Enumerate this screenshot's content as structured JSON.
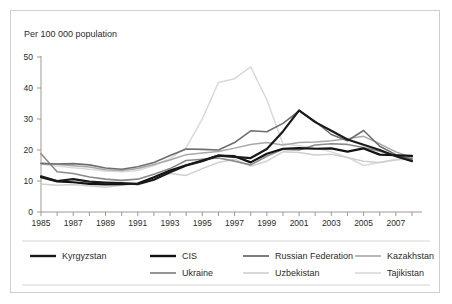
{
  "chart_data": {
    "type": "line",
    "title": "Per 100 000 population",
    "xlabel": "",
    "ylabel": "",
    "xlim": [
      1985,
      2008
    ],
    "ylim": [
      0,
      50
    ],
    "yticks": [
      0,
      10,
      20,
      30,
      40,
      50
    ],
    "ytick_labels": [
      "0",
      "10",
      "20",
      "30",
      "40",
      "50"
    ],
    "x": [
      1985,
      1986,
      1987,
      1988,
      1989,
      1990,
      1991,
      1992,
      1993,
      1994,
      1995,
      1996,
      1997,
      1998,
      1999,
      2000,
      2001,
      2002,
      2003,
      2004,
      2005,
      2006,
      2007,
      2008
    ],
    "xticks": [
      1985,
      1986,
      1987,
      1988,
      1989,
      1990,
      1991,
      1992,
      1993,
      1994,
      1995,
      1996,
      1997,
      1998,
      1999,
      2000,
      2001,
      2002,
      2003,
      2004,
      2005,
      2006,
      2007,
      2008
    ],
    "xtick_labels_shown": [
      "1985",
      "1987",
      "1989",
      "1991",
      "1993",
      "1995",
      "1997",
      "1999",
      "2001",
      "2003",
      "2005",
      "2007"
    ],
    "grid": false,
    "legend_position": "bottom",
    "series": [
      {
        "name": "Kyrgyzstan",
        "color": "#1a1a1a",
        "width": 2.2,
        "values": [
          11.5,
          10.0,
          10.6,
          9.8,
          9.5,
          9.3,
          9.0,
          10.4,
          12.8,
          15.0,
          16.4,
          18.2,
          17.8,
          17.4,
          20.3,
          26.0,
          32.8,
          29.0,
          26.2,
          23.4,
          21.7,
          20.0,
          18.0,
          16.4
        ]
      },
      {
        "name": "CIS",
        "color": "#121212",
        "width": 2.2,
        "values": [
          11.2,
          9.9,
          9.6,
          9.1,
          8.9,
          9.0,
          9.2,
          11.2,
          13.4,
          15.1,
          16.6,
          18.2,
          18.0,
          16.0,
          18.8,
          20.4,
          20.6,
          20.4,
          20.5,
          19.5,
          20.5,
          18.5,
          18.3,
          18.1
        ]
      },
      {
        "name": "Russian Federation",
        "color": "#6e6e6e",
        "width": 1.6,
        "values": [
          15.6,
          15.5,
          15.6,
          15.2,
          14.2,
          13.8,
          14.6,
          16.0,
          18.2,
          20.3,
          20.2,
          20.0,
          22.4,
          26.2,
          25.9,
          28.6,
          32.6,
          29.2,
          25.0,
          23.0,
          26.3,
          21.2,
          18.5,
          17.0
        ]
      },
      {
        "name": "Kazakhstan",
        "color": "#a8a8a8",
        "width": 1.5,
        "values": [
          15.8,
          15.4,
          14.9,
          14.5,
          13.6,
          13.4,
          14.0,
          15.3,
          16.8,
          18.5,
          19.0,
          19.5,
          20.6,
          21.8,
          22.4,
          21.6,
          22.4,
          22.6,
          23.0,
          23.6,
          24.4,
          22.0,
          19.4,
          17.6
        ]
      },
      {
        "name": "Ukraine",
        "color": "#8a8a8a",
        "width": 1.6,
        "values": [
          18.8,
          13.0,
          12.4,
          11.3,
          10.6,
          10.2,
          10.6,
          12.2,
          14.0,
          16.6,
          17.0,
          17.4,
          16.4,
          15.2,
          18.0,
          20.2,
          20.0,
          21.6,
          22.0,
          21.8,
          20.8,
          19.6,
          18.2,
          17.2
        ]
      },
      {
        "name": "Uzbekistan",
        "color": "#cfcfcf",
        "width": 1.5,
        "values": [
          9.0,
          8.6,
          8.9,
          8.4,
          8.0,
          8.6,
          9.2,
          11.0,
          12.4,
          11.8,
          14.0,
          16.0,
          17.0,
          14.8,
          16.4,
          19.4,
          19.2,
          18.4,
          18.6,
          17.6,
          16.4,
          16.0,
          16.8,
          17.2
        ]
      },
      {
        "name": "Tajikistan",
        "color": "#d9d9d9",
        "width": 1.5,
        "values": [
          15.4,
          14.8,
          14.3,
          13.8,
          13.2,
          13.0,
          13.4,
          15.0,
          17.2,
          20.8,
          30.0,
          41.8,
          43.0,
          46.8,
          36.2,
          22.0,
          21.4,
          20.6,
          19.4,
          17.6,
          15.0,
          16.0,
          17.0,
          17.4
        ]
      }
    ]
  },
  "legend": {
    "row1": [
      {
        "label": "Kyrgyzstan",
        "color": "#1a1a1a",
        "width": 2.4
      },
      {
        "label": "CIS",
        "color": "#121212",
        "width": 2.4
      },
      {
        "label": "Russian Federation",
        "color": "#6e6e6e",
        "width": 1.8
      },
      {
        "label": "Kazakhstan",
        "color": "#a8a8a8",
        "width": 1.6
      }
    ],
    "row2": [
      {
        "label": "Ukraine",
        "color": "#8a8a8a",
        "width": 1.8
      },
      {
        "label": "Uzbekistan",
        "color": "#cfcfcf",
        "width": 1.6
      },
      {
        "label": "Tajikistan",
        "color": "#d9d9d9",
        "width": 1.6
      }
    ]
  },
  "colors": {
    "frame": "#cfcfcf",
    "axis": "#9a9a9a",
    "text": "#2b2b2b",
    "background": "#ffffff"
  }
}
